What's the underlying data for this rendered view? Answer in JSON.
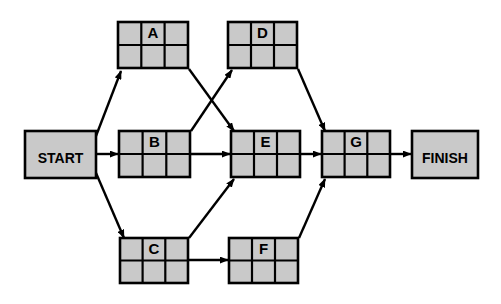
{
  "diagram": {
    "type": "activity-on-node-network",
    "title": "",
    "background_color": "#ffffff",
    "node_fill_color": "#c9c9c9",
    "node_border_color": "#000000",
    "edge_color": "#000000",
    "terminals": [
      {
        "id": "start",
        "label": "START",
        "x": 25,
        "y": 131,
        "width": 71,
        "height": 47
      },
      {
        "id": "finish",
        "label": "FINISH",
        "x": 412,
        "y": 131,
        "width": 66,
        "height": 47
      }
    ],
    "activities": [
      {
        "id": "a",
        "label": "A",
        "x": 118,
        "y": 22,
        "width": 70,
        "height": 46,
        "columns": 3,
        "rows": 2,
        "label_cell": "top-center"
      },
      {
        "id": "b",
        "label": "B",
        "x": 119,
        "y": 131,
        "width": 71,
        "height": 46,
        "columns": 3,
        "rows": 2,
        "label_cell": "top-center"
      },
      {
        "id": "c",
        "label": "C",
        "x": 120,
        "y": 238,
        "width": 68,
        "height": 45,
        "columns": 3,
        "rows": 2,
        "label_cell": "top-center"
      },
      {
        "id": "d",
        "label": "D",
        "x": 228,
        "y": 22,
        "width": 69,
        "height": 46,
        "columns": 3,
        "rows": 2,
        "label_cell": "top-center"
      },
      {
        "id": "e",
        "label": "E",
        "x": 231,
        "y": 131,
        "width": 69,
        "height": 46,
        "columns": 3,
        "rows": 2,
        "label_cell": "top-center"
      },
      {
        "id": "f",
        "label": "F",
        "x": 229,
        "y": 238,
        "width": 69,
        "height": 45,
        "columns": 3,
        "rows": 2,
        "label_cell": "top-center"
      },
      {
        "id": "g",
        "label": "G",
        "x": 322,
        "y": 131,
        "width": 68,
        "height": 46,
        "columns": 3,
        "rows": 2,
        "label_cell": "top-center"
      }
    ],
    "edges": [
      {
        "id": "start-a",
        "from": "START",
        "to": "A",
        "x1": 96,
        "y1": 136,
        "x2": 121,
        "y2": 69
      },
      {
        "id": "start-b",
        "from": "START",
        "to": "B",
        "x1": 96,
        "y1": 154,
        "x2": 117,
        "y2": 154
      },
      {
        "id": "start-c",
        "from": "START",
        "to": "C",
        "x1": 96,
        "y1": 173,
        "x2": 124,
        "y2": 238
      },
      {
        "id": "a-e",
        "from": "A",
        "to": "E",
        "x1": 189,
        "y1": 69,
        "x2": 234,
        "y2": 131
      },
      {
        "id": "b-d",
        "from": "B",
        "to": "D",
        "x1": 191,
        "y1": 131,
        "x2": 232,
        "y2": 69
      },
      {
        "id": "b-e",
        "from": "B",
        "to": "E",
        "x1": 191,
        "y1": 154,
        "x2": 229,
        "y2": 154
      },
      {
        "id": "c-e",
        "from": "C",
        "to": "E",
        "x1": 189,
        "y1": 238,
        "x2": 234,
        "y2": 178
      },
      {
        "id": "c-f",
        "from": "C",
        "to": "F",
        "x1": 189,
        "y1": 260,
        "x2": 227,
        "y2": 260
      },
      {
        "id": "d-g",
        "from": "D",
        "to": "G",
        "x1": 298,
        "y1": 69,
        "x2": 325,
        "y2": 131
      },
      {
        "id": "e-g",
        "from": "E",
        "to": "G",
        "x1": 301,
        "y1": 154,
        "x2": 320,
        "y2": 154
      },
      {
        "id": "f-g",
        "from": "F",
        "to": "G",
        "x1": 299,
        "y1": 238,
        "x2": 325,
        "y2": 178
      },
      {
        "id": "g-finish",
        "from": "G",
        "to": "FINISH",
        "x1": 391,
        "y1": 154,
        "x2": 410,
        "y2": 154
      }
    ]
  }
}
